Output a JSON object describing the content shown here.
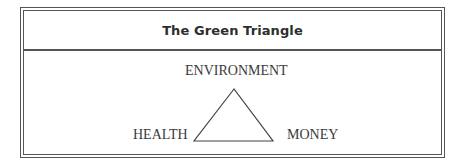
{
  "title": "The Green Triangle",
  "diagram": {
    "type": "triangle",
    "vertices": {
      "top": "ENVIRONMENT",
      "left": "HEALTH",
      "right": "MONEY"
    }
  },
  "colors": {
    "border": "#555555",
    "text": "#3a3a3a",
    "background": "#ffffff"
  }
}
